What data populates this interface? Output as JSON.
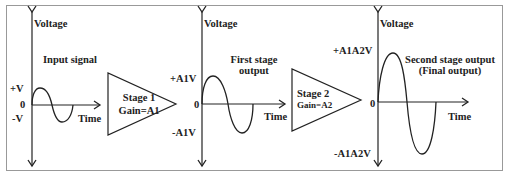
{
  "diagram": {
    "colors": {
      "stroke": "#222222",
      "frame": "#999999",
      "background": "#ffffff"
    },
    "panels": [
      {
        "axis_label": "Voltage",
        "time_label": "Time",
        "title": "Input signal",
        "title_line2": "",
        "pos_label": "+V",
        "zero_label": "0",
        "neg_label": "-V"
      },
      {
        "axis_label": "Voltage",
        "time_label": "Time",
        "title": "First stage",
        "title_line2": "output",
        "pos_label": "+A1V",
        "zero_label": "0",
        "neg_label": "-A1V"
      },
      {
        "axis_label": "Voltage",
        "time_label": "Time",
        "title": "Second stage output",
        "title_line2": "(Final output)",
        "pos_label": "+A1A2V",
        "zero_label": "0",
        "neg_label": "-A1A2V"
      }
    ],
    "stages": [
      {
        "name": "Stage 1",
        "gain": "Gain=A1"
      },
      {
        "name": "Stage 2",
        "gain": "Gain=A2"
      }
    ]
  }
}
